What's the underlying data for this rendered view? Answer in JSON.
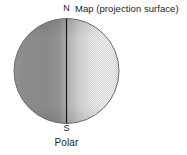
{
  "figure": {
    "caption": "Polar",
    "background_color": "#ffffff",
    "labels": {
      "north_pole": "N",
      "south_pole": "S",
      "map_surface": "Map (projection surface)",
      "projection_name": "Polar"
    },
    "globe": {
      "name": "globe-sphere",
      "center_x": 66.5,
      "center_y": 71,
      "radius": 52.5,
      "outline_color": "#5a5a5a",
      "shade_dark": "#8a8a8a",
      "shade_light": "#dcdcdc"
    },
    "projection_plane": {
      "name": "projection-plane-line",
      "orientation": "vertical",
      "x": 66.5,
      "y_top": 19,
      "y_bottom": 123,
      "color": "#151515",
      "description": "Map (projection surface) seen edge-on, tangent plane through the polar axis"
    }
  }
}
